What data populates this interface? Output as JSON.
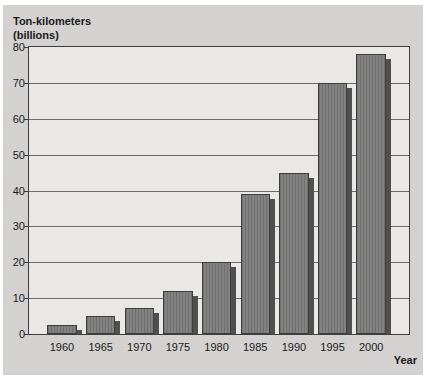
{
  "chart_data": {
    "type": "bar",
    "title_line1": "Ton-kilometers",
    "title_line2": "(billions)",
    "ylabel": "Ton-kilometers (billions)",
    "xlabel": "Year",
    "categories": [
      "1960",
      "1965",
      "1970",
      "1975",
      "1980",
      "1985",
      "1990",
      "1995",
      "2000"
    ],
    "values": [
      2.5,
      5,
      7.2,
      12,
      20,
      39,
      45,
      70,
      78
    ],
    "ylim": [
      0,
      80
    ],
    "yticks": [
      0,
      10,
      20,
      30,
      40,
      50,
      60,
      70,
      80
    ],
    "ytick_interval": 10,
    "grid": "horizontal",
    "legend": "none",
    "bar_style": "3d-drop-shadow"
  },
  "colors": {
    "panel_bg": "#d3d2d0",
    "plot_bg": "#e9e8e5",
    "bar_fill": "#7b7b7b",
    "bar_border": "#3d3d3d",
    "bar_shadow": "#4f4f4f",
    "gridline": "#6a6a6a",
    "axis": "#3d3d3d",
    "text": "#1a1a1a"
  }
}
